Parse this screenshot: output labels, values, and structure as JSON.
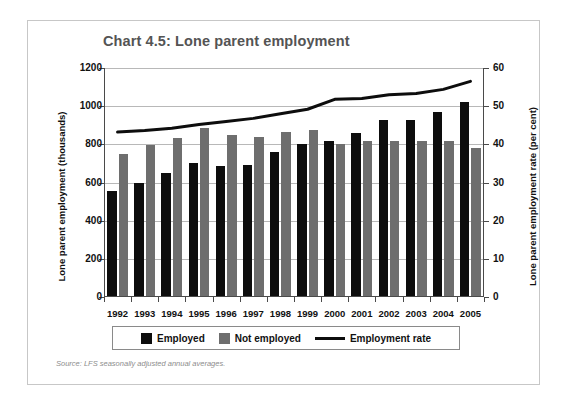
{
  "figure": {
    "title": "Chart 4.5: Lone parent employment",
    "source_note": "Source: LFS seasonally adjusted annual averages."
  },
  "legend": {
    "employed_label": "Employed",
    "not_employed_label": "Not employed",
    "rate_label": "Employment rate"
  },
  "colors": {
    "employed": "#0d0d0d",
    "not_employed": "#6e6e6e",
    "rate_line": "#0d0d0d",
    "title": "#545454",
    "frame": "#c7c7c7",
    "gridline": "#b8b8b8",
    "source_text": "#8c8c8c"
  },
  "chart_data": {
    "type": "bar",
    "title": "Chart 4.5: Lone parent employment",
    "xlabel": "",
    "ylabel": "Lone parent employment (thousands)",
    "y2label": "Lone parent employment rate (per cent)",
    "categories": [
      "1992",
      "1993",
      "1994",
      "1995",
      "1996",
      "1997",
      "1998",
      "1999",
      "2000",
      "2001",
      "2002",
      "2003",
      "2004",
      "2005"
    ],
    "ylim": [
      0,
      1200
    ],
    "yticks": [
      0,
      200,
      400,
      600,
      800,
      1000,
      1200
    ],
    "ytick_labels": [
      "0",
      "200",
      "400",
      "600",
      "800",
      "1000",
      "1200"
    ],
    "y2lim": [
      0,
      60
    ],
    "y2ticks": [
      0,
      10,
      20,
      30,
      40,
      50,
      60
    ],
    "y2tick_labels": [
      "0",
      "10",
      "20",
      "30",
      "40",
      "50",
      "60"
    ],
    "grid": true,
    "legend_position": "bottom",
    "series": [
      {
        "name": "Employed",
        "type": "bar",
        "axis": "left",
        "unit": "thousands",
        "color": "#0d0d0d",
        "values": [
          555,
          595,
          650,
          700,
          685,
          690,
          760,
          800,
          820,
          860,
          925,
          925,
          970,
          1020
        ]
      },
      {
        "name": "Not employed",
        "type": "bar",
        "axis": "left",
        "unit": "thousands",
        "color": "#6e6e6e",
        "values": [
          750,
          795,
          835,
          885,
          850,
          840,
          865,
          875,
          800,
          815,
          815,
          815,
          820,
          780
        ]
      },
      {
        "name": "Employment rate",
        "type": "line",
        "axis": "right",
        "unit": "per cent",
        "color": "#0d0d0d",
        "values": [
          43.2,
          43.6,
          44.2,
          45.2,
          46.0,
          46.8,
          48.0,
          49.2,
          51.8,
          52.0,
          53.0,
          53.3,
          54.4,
          56.5
        ]
      }
    ]
  }
}
